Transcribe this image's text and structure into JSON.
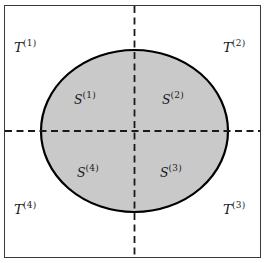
{
  "figure": {
    "type": "geometric-diagram",
    "background_color": "#ffffff",
    "frame_color": "#3a3a3a",
    "ellipse_fill_color": "#c9c9c9",
    "ellipse_stroke_color": "#000000",
    "dashed_line_color": "#1a1a1a"
  },
  "geometry": {
    "frame": {
      "x": 4,
      "y": 5,
      "width": 257,
      "height": 253
    },
    "ellipse": {
      "cx": 134.5,
      "cy": 131,
      "rx": 93.5,
      "ry": 81
    },
    "vertical_axis_x": 134.5,
    "horizontal_axis_y": 131
  },
  "labels": {
    "outer_regions": [
      {
        "name": "T1",
        "base": "T",
        "superscript": "(1)",
        "quadrant": "top-left",
        "x": 14,
        "y": 39
      },
      {
        "name": "T2",
        "base": "T",
        "superscript": "(2)",
        "quadrant": "top-right",
        "x": 223,
        "y": 39
      },
      {
        "name": "T3",
        "base": "T",
        "superscript": "(3)",
        "quadrant": "bottom-right",
        "x": 223,
        "y": 201
      },
      {
        "name": "T4",
        "base": "T",
        "superscript": "(4)",
        "quadrant": "bottom-left",
        "x": 14,
        "y": 201
      }
    ],
    "inner_regions": [
      {
        "name": "S1",
        "base": "S",
        "superscript": "(1)",
        "quadrant": "top-left",
        "x": 74,
        "y": 91
      },
      {
        "name": "S2",
        "base": "S",
        "superscript": "(2)",
        "quadrant": "top-right",
        "x": 162,
        "y": 91
      },
      {
        "name": "S3",
        "base": "S",
        "superscript": "(3)",
        "quadrant": "bottom-right",
        "x": 160,
        "y": 164
      },
      {
        "name": "S4",
        "base": "S",
        "superscript": "(4)",
        "quadrant": "bottom-left",
        "x": 77,
        "y": 164
      }
    ]
  }
}
